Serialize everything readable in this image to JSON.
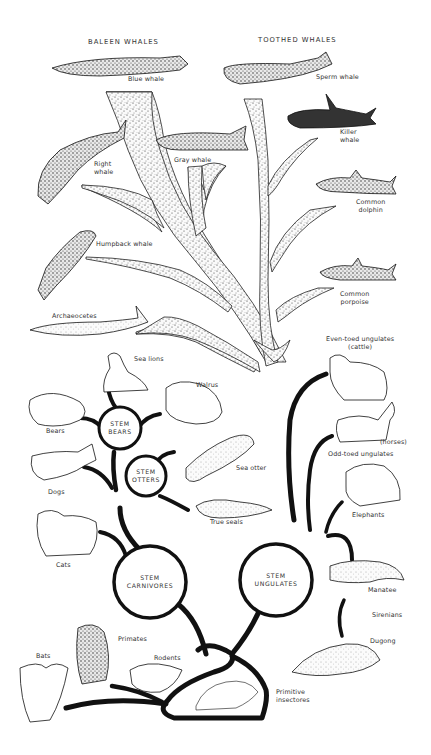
{
  "diagram": {
    "type": "evolutionary-tree",
    "headers": {
      "baleen": "BALEEN WHALES",
      "toothed": "TOOTHED WHALES"
    },
    "stem_groups": {
      "bears": [
        "STEM",
        "BEARS"
      ],
      "otters": [
        "STEM",
        "OTTERS"
      ],
      "carnivores": [
        "STEM",
        "CARNIVORES"
      ],
      "ungulates": [
        "STEM",
        "UNGULATES"
      ]
    },
    "labels": {
      "blue_whale": "Blue whale",
      "sperm_whale": "Sperm whale",
      "killer_whale": [
        "Killer",
        "whale"
      ],
      "gray_whale": "Gray whale",
      "right_whale": [
        "Right",
        "whale"
      ],
      "common_dolphin": [
        "Common",
        "dolphin"
      ],
      "humpback_whale": "Humpback whale",
      "common_porpoise": [
        "Common",
        "porpoise"
      ],
      "archaeocetes": "Archaeocetes",
      "even_toed": [
        "Even-toed ungulates",
        "(cattle)"
      ],
      "sea_lions": "Sea lions",
      "walrus": "Walrus",
      "bears": "Bears",
      "horses": "(horses)",
      "odd_toed": "Odd-toed ungulates",
      "sea_otter": "Sea otter",
      "dogs": "Dogs",
      "elephants": "Elephants",
      "true_seals": "True seals",
      "cats": "Cats",
      "manatee": "Manatee",
      "sirenians": "Sirenians",
      "primates": "Primates",
      "bats": "Bats",
      "rodents": "Rodents",
      "dugong": "Dugong",
      "primitive_insectivores": [
        "Primitive",
        "insectores"
      ]
    },
    "caption_partial": "(caption cut off at bottom edge)"
  },
  "colors": {
    "ink": "#111111",
    "label": "#333333",
    "stipple_fill": "#f2f2f2",
    "background": "#ffffff"
  }
}
